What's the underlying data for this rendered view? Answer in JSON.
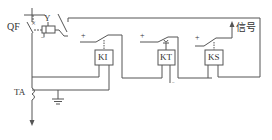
{
  "diagram": {
    "title": "",
    "labels": {
      "qf": "QF",
      "y": "Y",
      "ki": "KI",
      "kt": "KT",
      "ks": "KS",
      "ta": "TA",
      "signal": "信号",
      "plus_ki": "+",
      "plus_kt": "+",
      "plus_ks": "+",
      "minus_ks": "−",
      "minus_y": "−",
      "minus_kt": "−",
      "plus_y": "+"
    },
    "stroke_color": "#555555"
  }
}
